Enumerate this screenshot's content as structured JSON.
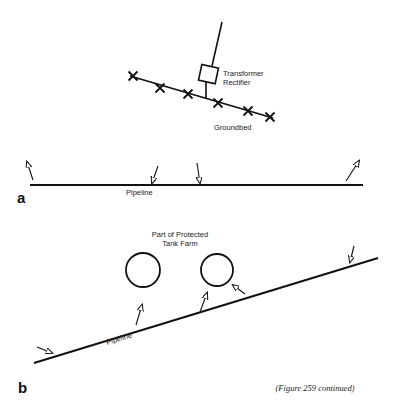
{
  "figure": {
    "caption": "(Figure 259 continued)",
    "ink_color": "#111111",
    "background": "#ffffff"
  },
  "panel_a": {
    "label": "a",
    "groundbed": {
      "label": "Groundbed",
      "line": [
        130,
        76,
        273,
        118
      ],
      "anodes": [
        [
          133,
          76
        ],
        [
          160,
          88
        ],
        [
          188,
          94
        ],
        [
          218,
          103
        ],
        [
          248,
          111
        ],
        [
          270,
          117
        ]
      ]
    },
    "transformer_rectifier": {
      "label_line1": "Transformer",
      "label_line2": "Rectifier",
      "box": [
        200,
        66,
        17,
        16
      ],
      "cable_up": [
        212,
        66,
        222,
        22
      ],
      "cable_down": [
        206,
        82,
        206,
        98
      ]
    },
    "pipeline": {
      "label": "Pipeline",
      "line": [
        30,
        185,
        363,
        185
      ]
    },
    "current_arrows": [
      {
        "from": [
          33,
          180
        ],
        "to": [
          27,
          162
        ]
      },
      {
        "from": [
          158,
          166
        ],
        "to": [
          152,
          183
        ]
      },
      {
        "from": [
          197,
          163
        ],
        "to": [
          200,
          183
        ]
      },
      {
        "from": [
          346,
          181
        ],
        "to": [
          359,
          161
        ]
      }
    ]
  },
  "panel_b": {
    "label": "b",
    "tank_farm": {
      "label_line1": "Part of Protected",
      "label_line2": "Tank Farm",
      "tanks": [
        {
          "cx": 143,
          "cy": 270,
          "r": 17
        },
        {
          "cx": 217,
          "cy": 270,
          "r": 16
        }
      ]
    },
    "pipeline": {
      "label": "Pipeline",
      "line": [
        34,
        363,
        378,
        258
      ]
    },
    "current_arrows": [
      {
        "from": [
          37,
          347
        ],
        "to": [
          52,
          353
        ]
      },
      {
        "from": [
          136,
          325
        ],
        "to": [
          142,
          305
        ]
      },
      {
        "from": [
          200,
          312
        ],
        "to": [
          207,
          293
        ]
      },
      {
        "from": [
          245,
          294
        ],
        "to": [
          233,
          285
        ]
      },
      {
        "from": [
          354,
          246
        ],
        "to": [
          350,
          262
        ]
      }
    ]
  }
}
